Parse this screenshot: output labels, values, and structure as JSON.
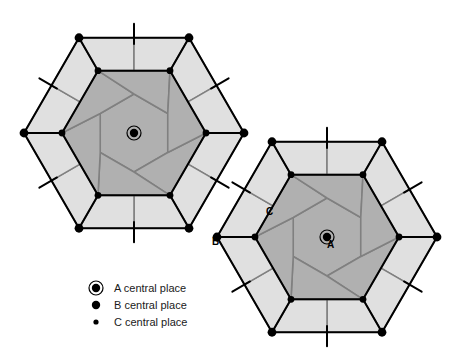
{
  "figure": {
    "type": "diagram",
    "background_color": "#ffffff",
    "colors": {
      "inner_fill": "#b0b0b0",
      "outer_fill": "#e0e0e0",
      "inner_stroke": "#808080",
      "outer_stroke": "#808080",
      "heavy_stroke": "#000000",
      "text": "#000000"
    },
    "stroke_widths": {
      "heavy": 2.0,
      "light": 1.6
    }
  },
  "legend": {
    "items": [
      {
        "key": "A",
        "marker": "ringed-dot-icon",
        "label": "A central place",
        "radius": 4.2,
        "ring_radius": 7.0
      },
      {
        "key": "B",
        "marker": "large-dot-icon",
        "label": "B central place",
        "radius": 4.2,
        "ring_radius": 0
      },
      {
        "key": "C",
        "marker": "small-dot-icon",
        "label": "C central place",
        "radius": 2.6,
        "ring_radius": 0
      }
    ],
    "origin": {
      "x": 96,
      "y": 288
    },
    "row_gap": 17,
    "label_offset_x": 18
  },
  "annotations": [
    {
      "text": "A",
      "x": 327,
      "y": 248,
      "anchor": "start",
      "refers_to": "A central place of right cluster"
    },
    {
      "text": "B",
      "x": 212,
      "y": 245,
      "anchor": "start",
      "refers_to": "B central place at shared vertex"
    },
    {
      "text": "C",
      "x": 266,
      "y": 215,
      "anchor": "start",
      "refers_to": "C central place on cluster edge"
    }
  ],
  "clusters": [
    {
      "name": "left-cluster",
      "center": {
        "x": 134,
        "y": 133
      },
      "outer_radius": 110,
      "inner_radius": 39,
      "mid_radius": 72,
      "rotation_deg": 0,
      "center_place": "A"
    },
    {
      "name": "right-cluster",
      "center": {
        "x": 327,
        "y": 237
      },
      "outer_radius": 110,
      "inner_radius": 39,
      "mid_radius": 72,
      "rotation_deg": 0,
      "center_place": "A"
    }
  ],
  "geometry_notes": {
    "k_value": 7,
    "outer_hexagon_orientation": "flat-left-right-vertices (pointy sides top/bottom)",
    "spoke_length": 14,
    "description": "Each cluster is a k=7 Christaller market area: a central A place, an inner hexagonal market area subdivided into 7 cells, and an outer ring of 6 lighter cells; vertices carry B and C central places."
  }
}
